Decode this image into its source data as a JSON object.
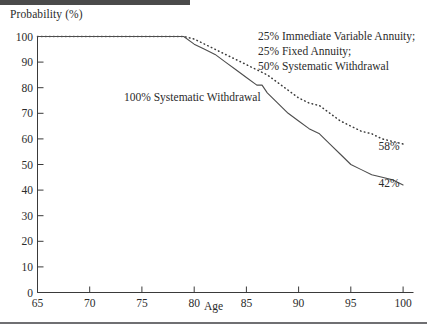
{
  "figure": {
    "ylabel": "Probability (%)",
    "xlabel": "Age"
  },
  "chart_data": {
    "type": "line",
    "title": "",
    "subtitle": "",
    "xlabel": "Age",
    "ylabel": "Probability (%)",
    "xlim": [
      65,
      101
    ],
    "ylim": [
      0,
      100
    ],
    "xticks": [
      65,
      70,
      75,
      80,
      85,
      90,
      95,
      100
    ],
    "xticklabels": [
      "65",
      "70",
      "75",
      "80",
      "85",
      "90",
      "95",
      "100"
    ],
    "yticks": [
      0,
      10,
      20,
      30,
      40,
      50,
      60,
      70,
      80,
      90,
      100
    ],
    "yticklabels": [
      "0",
      "10",
      "20",
      "30",
      "40",
      "50",
      "60",
      "70",
      "80",
      "90",
      "100"
    ],
    "grid": false,
    "legend_position": "inline-annotations",
    "series": [
      {
        "name": "100% Systematic Withdrawal",
        "style": "solid",
        "annotation": "100% Systematic Withdrawal",
        "end_label": "42%",
        "x": [
          65,
          70,
          75,
          78,
          79,
          80,
          81,
          82,
          83,
          84,
          85,
          86,
          86.5,
          87,
          88,
          89,
          90,
          91,
          92,
          93,
          94,
          95,
          96,
          97,
          98,
          99,
          100
        ],
        "y": [
          100,
          100,
          100,
          100,
          100,
          97,
          95,
          93,
          90,
          87,
          84,
          81,
          81,
          78,
          74,
          70,
          67,
          64,
          62,
          58,
          54,
          50,
          48,
          46,
          45,
          44,
          42
        ]
      },
      {
        "name": "25% Immediate Variable Annuity; 25% Fixed Annuity; 50% Systematic Withdrawal",
        "style": "dotted",
        "annotation": "25% Immediate Variable Annuity;\n25% Fixed Annuity;\n50% Systematic Withdrawal",
        "end_label": "58%",
        "x": [
          65,
          70,
          75,
          78,
          79,
          80,
          81,
          82,
          83,
          84,
          85,
          86,
          87,
          88,
          89,
          90,
          91,
          92,
          93,
          94,
          95,
          96,
          97,
          98,
          99,
          100
        ],
        "y": [
          100,
          100,
          100,
          100,
          100,
          99,
          97,
          95,
          93,
          91,
          89,
          87,
          85,
          82,
          79,
          76,
          74,
          73,
          70,
          67,
          65,
          63,
          62,
          60,
          59,
          58
        ]
      }
    ],
    "annotations": [
      {
        "id": "annot-solid",
        "text": "100% Systematic Withdrawal",
        "lines": [
          "100% Systematic Withdrawal"
        ]
      },
      {
        "id": "annot-dotted",
        "text": "25% Immediate Variable Annuity; 25% Fixed Annuity; 50% Systematic Withdrawal",
        "lines": [
          "25% Immediate Variable Annuity;",
          "25% Fixed Annuity;",
          "50% Systematic Withdrawal"
        ]
      }
    ],
    "end_labels": [
      {
        "id": "end-dotted",
        "text": "58%"
      },
      {
        "id": "end-solid",
        "text": "42%"
      }
    ]
  }
}
